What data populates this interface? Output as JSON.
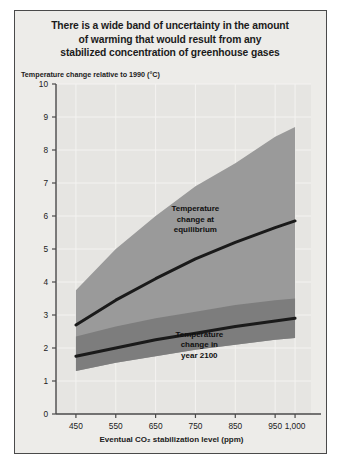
{
  "figure": {
    "title": "There is a wide band of uncertainty in the amount of warming that would result from any stabilized concentration of greenhouse gases",
    "title_line1": "There is a wide band of uncertainty in the amount",
    "title_line2": "of warming that would result from any",
    "title_line3": "stabilized concentration of greenhouse gases",
    "background_color": "#edece9",
    "border_color": "#4a4a4a"
  },
  "annotations": {
    "equilibrium": {
      "line1": "Temperature",
      "line2": "change at",
      "line3": "equilibrium"
    },
    "year2100": {
      "line1": "Temperature",
      "line2": "change in",
      "line3": "year 2100"
    }
  },
  "chart_data": {
    "type": "area",
    "title": "There is a wide band of uncertainty in the amount of warming that would result from any stabilized concentration of greenhouse gases",
    "subtitle": "",
    "xlabel": "Eventual CO₂ stabilization level (ppm)",
    "ylabel": "Temperature change relative to 1990 (°C)",
    "xlim": [
      400,
      1040
    ],
    "ylim": [
      0,
      10
    ],
    "xticks": [
      450,
      550,
      650,
      750,
      850,
      950,
      1000
    ],
    "xtick_labels": [
      "450",
      "550",
      "650",
      "750",
      "850",
      "950",
      "1,000"
    ],
    "yticks": [
      0,
      1,
      2,
      3,
      4,
      5,
      6,
      7,
      8,
      9,
      10
    ],
    "ytick_labels": [
      "0",
      "1",
      "2",
      "3",
      "4",
      "5",
      "6",
      "7",
      "8",
      "9",
      "10"
    ],
    "grid": true,
    "legend": "none",
    "x": [
      450,
      550,
      650,
      750,
      850,
      950,
      1000
    ],
    "series": [
      {
        "name": "Temperature change at equilibrium",
        "type": "line",
        "color": "#1a1a1a",
        "values": [
          2.7,
          3.45,
          4.1,
          4.7,
          5.2,
          5.65,
          5.85
        ]
      },
      {
        "name": "Temperature change in year 2100",
        "type": "line",
        "color": "#1a1a1a",
        "values": [
          1.75,
          2.0,
          2.25,
          2.45,
          2.65,
          2.82,
          2.9
        ]
      },
      {
        "name": "Equilibrium uncertainty band",
        "type": "band",
        "color": "#9a9a9a",
        "upper": [
          3.75,
          5.0,
          6.0,
          6.9,
          7.6,
          8.4,
          8.7
        ],
        "lower": [
          1.3,
          1.55,
          1.75,
          1.95,
          2.1,
          2.25,
          2.3
        ]
      },
      {
        "name": "Year 2100 uncertainty band",
        "type": "band",
        "color": "#7d7d7d",
        "upper": [
          2.35,
          2.65,
          2.9,
          3.1,
          3.3,
          3.45,
          3.5
        ],
        "lower": [
          1.3,
          1.55,
          1.75,
          1.95,
          2.1,
          2.25,
          2.3
        ]
      }
    ]
  }
}
